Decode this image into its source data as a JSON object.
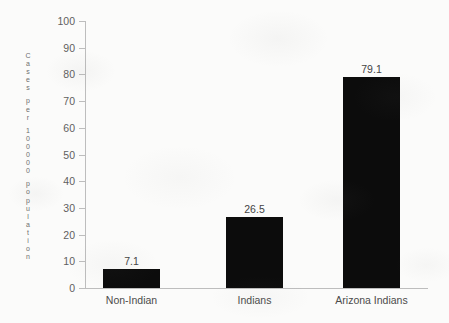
{
  "chart_data": {
    "type": "bar",
    "title": "",
    "xlabel": "",
    "ylabel": "Cases per 100000 population",
    "categories": [
      "Non-Indian",
      "Indians",
      "Arizona Indians"
    ],
    "values": [
      7.1,
      26.5,
      79.1
    ],
    "value_labels": [
      "7.1",
      "26.5",
      "79.1"
    ],
    "ylim": [
      0,
      100
    ],
    "ytick_labels": [
      "100",
      "90",
      "80",
      "70",
      "60",
      "50",
      "40",
      "30",
      "20",
      "10",
      "0"
    ],
    "ytick_values": [
      100,
      90,
      80,
      70,
      60,
      50,
      40,
      30,
      20,
      10,
      0
    ],
    "grid": false,
    "legend": null,
    "bar_color": "#0c0c0c",
    "axis_color": "#bdbdbd",
    "text_color": "#4b4b4b",
    "background_color": "#fbfbfa"
  }
}
